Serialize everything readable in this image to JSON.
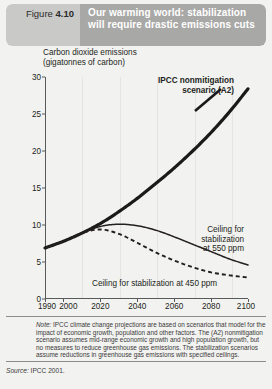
{
  "header": {
    "figure_label": "Figure",
    "figure_number": "4.10",
    "title": "Our warming world: stabilization will require drastic emissions cuts",
    "tag_bg": "#c9c9c7",
    "title_bg": "#a8a8a6",
    "title_color": "#ffffff"
  },
  "chart_data": {
    "type": "line",
    "title": "Our warming world: stabilization will require drastic emissions cuts",
    "ylabel": "Carbon dioxide emissions\n(gigatonnes of carbon)",
    "xlabel": "",
    "xlim": [
      1990,
      2100
    ],
    "ylim": [
      0,
      30
    ],
    "yticks": [
      0,
      5,
      10,
      15,
      20,
      25,
      30
    ],
    "xticks": [
      1990,
      2000,
      2020,
      2040,
      2060,
      2080,
      2100
    ],
    "xtick_labels": [
      "1990",
      "2000",
      "2020",
      "2040",
      "2060",
      "2080",
      "2100"
    ],
    "ytick_labels": [
      "0",
      "5",
      "10",
      "15",
      "20",
      "25",
      "30"
    ],
    "grid": "faint vertical gridlines at x ticks",
    "legend": "inline annotations",
    "series": [
      {
        "name": "IPCC nonmitigation scenario (A2)",
        "style": "solid-thick",
        "color": "#1a1a1a",
        "x": [
          1990,
          2000,
          2010,
          2020,
          2030,
          2040,
          2050,
          2060,
          2070,
          2080,
          2090,
          2100
        ],
        "values": [
          6.9,
          7.8,
          8.9,
          10.2,
          11.8,
          13.6,
          15.6,
          17.7,
          20.0,
          22.5,
          25.3,
          28.4
        ]
      },
      {
        "name": "Ceiling for stabilization at 550 ppm",
        "style": "solid-thin",
        "color": "#231f20",
        "x": [
          1990,
          2000,
          2010,
          2020,
          2030,
          2040,
          2050,
          2060,
          2070,
          2080,
          2090,
          2100
        ],
        "values": [
          6.9,
          7.8,
          8.9,
          9.8,
          10.1,
          9.9,
          9.3,
          8.4,
          7.4,
          6.4,
          5.4,
          4.6
        ]
      },
      {
        "name": "Ceiling for stabilization at 450 ppm",
        "style": "dashed",
        "color": "#231f20",
        "x": [
          1990,
          2000,
          2010,
          2020,
          2030,
          2040,
          2050,
          2060,
          2070,
          2080,
          2090,
          2100
        ],
        "values": [
          6.9,
          7.8,
          8.9,
          9.4,
          8.8,
          7.6,
          6.3,
          5.2,
          4.3,
          3.6,
          3.2,
          2.9
        ]
      }
    ],
    "annotations": [
      {
        "id": "a2",
        "text": "IPCC nonmitigation\nscenario (A2)",
        "bold": true
      },
      {
        "id": "c550",
        "text": "Ceiling for\nstabilization\nat 550 ppm",
        "bold": false
      },
      {
        "id": "c450",
        "text": "Ceiling for stabilization at 450 ppm",
        "bold": false
      }
    ]
  },
  "footer": {
    "note_prefix": "Note:",
    "note": " IPCC climate change projections are based on scenarios that model for the impact of economic growth, population and other factors. The (A2) nonmitigation scenario assumes mid-range economic growth and high population growth, but no measures to reduce greenhouse gas emissions. The stabilization scenarios assume reductions in greenhouse gas emissions with specified ceilings.",
    "source_prefix": "Source:",
    "source": " IPCC 2001."
  }
}
